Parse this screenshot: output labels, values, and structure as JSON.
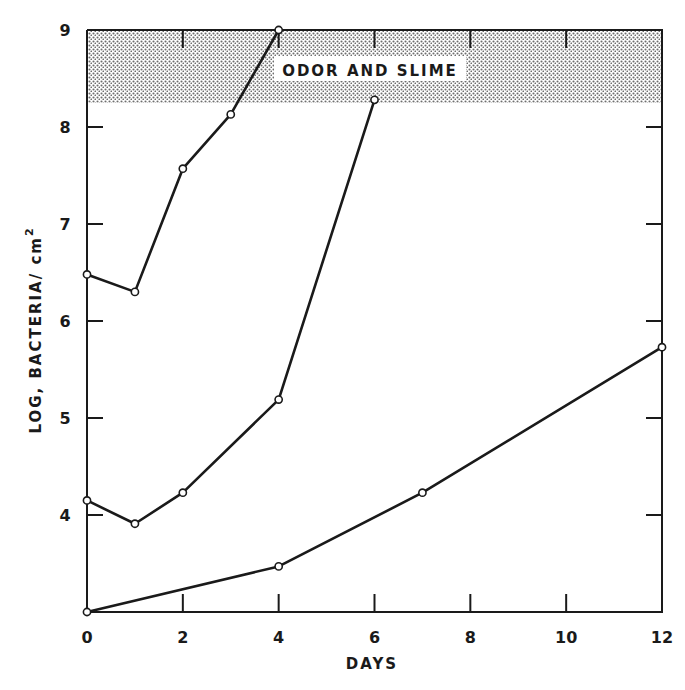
{
  "chart_data": {
    "type": "line",
    "title": "",
    "xlabel": "DAYS",
    "ylabel": "LOG, BACTERIA/ cm",
    "ylabel_superscript": "2",
    "xlim": [
      0,
      12
    ],
    "ylim": [
      3,
      9
    ],
    "x_ticks": [
      0,
      2,
      4,
      6,
      8,
      10,
      12
    ],
    "y_ticks": [
      4,
      5,
      6,
      7,
      8,
      9
    ],
    "grid": false,
    "legend": null,
    "marker": "open-circle",
    "annotations": [
      {
        "type": "shaded_band",
        "y_from": 8.25,
        "y_to": 9,
        "pattern": "dotted",
        "label": "ODOR AND SLIME"
      }
    ],
    "series": [
      {
        "name": "series-1",
        "x": [
          0,
          1,
          2,
          3,
          4
        ],
        "values": [
          6.48,
          6.3,
          7.57,
          8.13,
          9.0
        ]
      },
      {
        "name": "series-2",
        "x": [
          0,
          1,
          2,
          4,
          6
        ],
        "values": [
          4.15,
          3.91,
          4.23,
          5.19,
          8.28
        ]
      },
      {
        "name": "series-3",
        "x": [
          0,
          4,
          7,
          12
        ],
        "values": [
          3.0,
          3.47,
          4.23,
          5.73
        ]
      }
    ]
  },
  "colors": {
    "ink": "#1a1a1a",
    "band_dot": "#6e6e6e",
    "background": "#ffffff"
  }
}
